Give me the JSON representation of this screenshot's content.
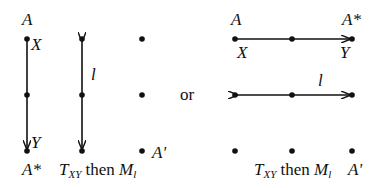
{
  "left_diagram": {
    "labels": {
      "A": "A",
      "X": "X",
      "Y": "Y",
      "A_star": "A*",
      "l": "l",
      "A_prime": "A'"
    },
    "caption": {
      "T": "T",
      "T_sub": "XY",
      "then": " then ",
      "M": "M",
      "M_sub": "l"
    }
  },
  "connector": "or",
  "right_diagram": {
    "labels": {
      "A": "A",
      "A_star": "A*",
      "X": "X",
      "Y": "Y",
      "l": "l",
      "A_prime": "A'"
    },
    "caption": {
      "T": "T",
      "T_sub": "XY",
      "then": " then ",
      "M": "M",
      "M_sub": "l"
    }
  },
  "colors": {
    "ink": "#111111",
    "background": "#ffffff"
  }
}
